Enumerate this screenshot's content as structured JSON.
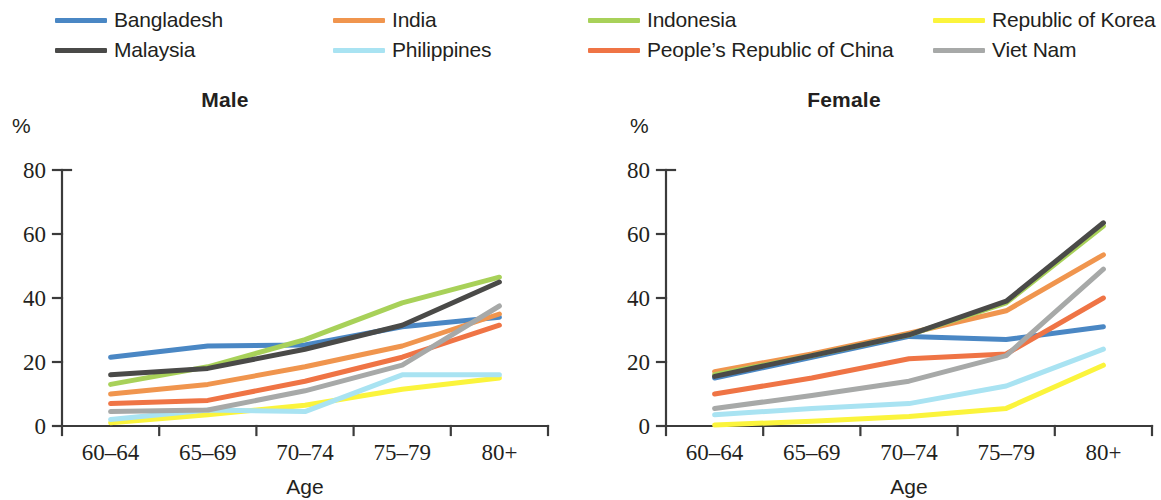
{
  "legend": {
    "items": [
      {
        "label": "Bangladesh",
        "color": "#4a87c4",
        "icon": "line-swatch-icon"
      },
      {
        "label": "India",
        "color": "#f0954e",
        "icon": "line-swatch-icon"
      },
      {
        "label": "Indonesia",
        "color": "#a8d159",
        "icon": "line-swatch-icon"
      },
      {
        "label": "Republic of Korea",
        "color": "#fbf43c",
        "icon": "line-swatch-icon"
      },
      {
        "label": "Malaysia",
        "color": "#4a4a48",
        "icon": "line-swatch-icon"
      },
      {
        "label": "Philippines",
        "color": "#a9e3f2",
        "icon": "line-swatch-icon"
      },
      {
        "label": "People’s Republic of China",
        "color": "#ef7445",
        "icon": "line-swatch-icon"
      },
      {
        "label": "Viet Nam",
        "color": "#a7a9a8",
        "icon": "line-swatch-icon"
      }
    ]
  },
  "chart_data": [
    {
      "type": "line",
      "title": "Male",
      "xlabel": "Age",
      "ylabel": "%",
      "categories": [
        "60–64",
        "65–69",
        "70–74",
        "75–79",
        "80+"
      ],
      "yticks": [
        0,
        20,
        40,
        60,
        80
      ],
      "ylim": [
        0,
        80
      ],
      "grid": false,
      "legend_position": "top",
      "series": [
        {
          "name": "Bangladesh",
          "color": "#4a87c4",
          "values": [
            21.5,
            25.0,
            25.3,
            31.0,
            34.0
          ]
        },
        {
          "name": "India",
          "color": "#f0954e",
          "values": [
            10.0,
            13.0,
            18.5,
            25.0,
            35.0
          ]
        },
        {
          "name": "Indonesia",
          "color": "#a8d159",
          "values": [
            13.0,
            18.5,
            27.0,
            38.5,
            46.5
          ]
        },
        {
          "name": "Republic of Korea",
          "color": "#fbf43c",
          "values": [
            1.0,
            3.5,
            6.5,
            11.5,
            15.0
          ]
        },
        {
          "name": "Malaysia",
          "color": "#4a4a48",
          "values": [
            16.0,
            18.0,
            24.0,
            31.5,
            45.0
          ]
        },
        {
          "name": "Philippines",
          "color": "#a9e3f2",
          "values": [
            2.0,
            5.0,
            4.5,
            16.0,
            16.0
          ]
        },
        {
          "name": "People’s Republic of China",
          "color": "#ef7445",
          "values": [
            7.0,
            8.0,
            14.0,
            21.5,
            31.5
          ]
        },
        {
          "name": "Viet Nam",
          "color": "#a7a9a8",
          "values": [
            4.5,
            5.0,
            11.0,
            19.0,
            37.5
          ]
        }
      ]
    },
    {
      "type": "line",
      "title": "Female",
      "xlabel": "Age",
      "ylabel": "%",
      "categories": [
        "60–64",
        "65–69",
        "70–74",
        "75–79",
        "80+"
      ],
      "yticks": [
        0,
        20,
        40,
        60,
        80
      ],
      "ylim": [
        0,
        80
      ],
      "grid": false,
      "legend_position": "top",
      "series": [
        {
          "name": "Bangladesh",
          "color": "#4a87c4",
          "values": [
            15.0,
            21.5,
            28.0,
            27.0,
            31.0
          ]
        },
        {
          "name": "India",
          "color": "#f0954e",
          "values": [
            17.0,
            22.5,
            29.0,
            36.0,
            53.5
          ]
        },
        {
          "name": "Indonesia",
          "color": "#a8d159",
          "values": [
            16.0,
            22.0,
            28.5,
            38.5,
            62.5
          ]
        },
        {
          "name": "Republic of Korea",
          "color": "#fbf43c",
          "values": [
            0.3,
            1.5,
            3.0,
            5.5,
            19.0
          ]
        },
        {
          "name": "Malaysia",
          "color": "#4a4a48",
          "values": [
            15.5,
            22.0,
            28.5,
            39.0,
            63.5
          ]
        },
        {
          "name": "Philippines",
          "color": "#a9e3f2",
          "values": [
            3.5,
            5.5,
            7.0,
            12.5,
            24.0
          ]
        },
        {
          "name": "People’s Republic of China",
          "color": "#ef7445",
          "values": [
            10.0,
            15.0,
            21.0,
            22.5,
            40.0
          ]
        },
        {
          "name": "Viet Nam",
          "color": "#a7a9a8",
          "values": [
            5.5,
            9.5,
            14.0,
            22.0,
            49.0
          ]
        }
      ]
    }
  ]
}
